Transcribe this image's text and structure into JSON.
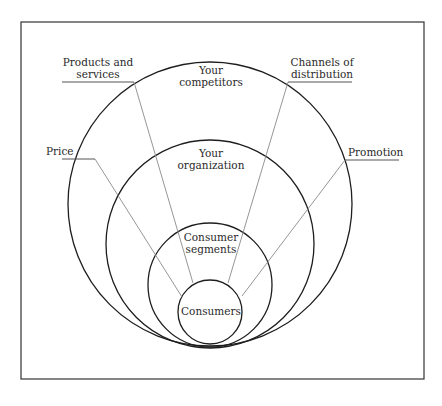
{
  "diagram": {
    "rings": [
      {
        "id": "competitors",
        "lines": [
          "Your",
          "competitors"
        ]
      },
      {
        "id": "organization",
        "lines": [
          "Your",
          "organization"
        ]
      },
      {
        "id": "segments",
        "lines": [
          "Consumer",
          "segments"
        ]
      },
      {
        "id": "consumers",
        "lines": [
          "Consumers"
        ]
      }
    ],
    "factors": [
      {
        "id": "products",
        "lines": [
          "Products and",
          "services"
        ]
      },
      {
        "id": "channels",
        "lines": [
          "Channels of",
          "distribution"
        ]
      },
      {
        "id": "price",
        "lines": [
          "Price"
        ]
      },
      {
        "id": "promotion",
        "lines": [
          "Promotion"
        ]
      }
    ]
  }
}
